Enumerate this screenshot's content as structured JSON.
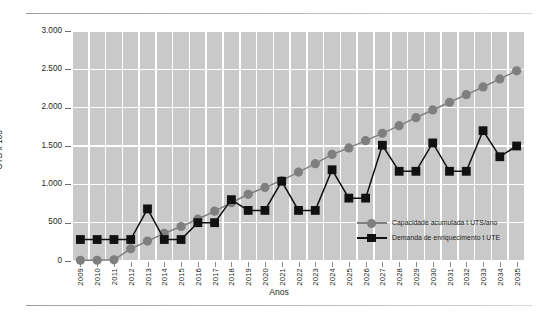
{
  "chart_data": {
    "type": "line",
    "title": "",
    "xlabel": "Anos",
    "ylabel": "UTS x 103",
    "ylim": [
      0,
      3000
    ],
    "yticks": [
      0,
      500,
      1000,
      1500,
      2000,
      2500,
      3000
    ],
    "ytick_labels": [
      "0",
      "500",
      "1.000",
      "1.500",
      "2.000",
      "2.500",
      "3.000"
    ],
    "grid": true,
    "legend_position": "inside-bottom-right",
    "categories": [
      "2009",
      "2010",
      "2011",
      "2012",
      "2013",
      "2014",
      "2015",
      "2016",
      "2017",
      "2018",
      "2019",
      "2020",
      "2021",
      "2022",
      "2023",
      "2024",
      "2025",
      "2026",
      "2027",
      "2028",
      "2029",
      "2030",
      "2031",
      "2032",
      "2033",
      "2034",
      "2035"
    ],
    "series": [
      {
        "name": "Capacidade acumulada t UTS/ano",
        "marker": "circle",
        "color": "#7f7f7f",
        "values": [
          10,
          10,
          15,
          160,
          260,
          360,
          450,
          545,
          650,
          760,
          870,
          960,
          1050,
          1160,
          1270,
          1390,
          1475,
          1570,
          1665,
          1765,
          1870,
          1970,
          2070,
          2170,
          2270,
          2375,
          2480
        ]
      },
      {
        "name": "Demanda de enriquecimento t UTE",
        "marker": "square",
        "color": "#111111",
        "values": [
          280,
          280,
          280,
          280,
          680,
          280,
          280,
          500,
          500,
          800,
          660,
          660,
          1040,
          660,
          660,
          1190,
          820,
          820,
          1510,
          1170,
          1170,
          1540,
          1170,
          1170,
          1700,
          1360,
          1500
        ]
      }
    ]
  },
  "axes": {
    "y_title": "UTS x 103",
    "x_title": "Anos"
  },
  "legend": {
    "items": [
      {
        "label": "Capacidade acumulada t UTS/ano",
        "marker": "circle-marker-icon",
        "color": "#7f7f7f"
      },
      {
        "label": "Demanda de enriquecimento t UTE",
        "marker": "square-marker-icon",
        "color": "#111111"
      }
    ]
  },
  "colors": {
    "plot_background": "#c9c9c9",
    "gridline": "#ffffff",
    "series_capacidade": "#7f7f7f",
    "series_demanda": "#111111",
    "text": "#231f20"
  }
}
